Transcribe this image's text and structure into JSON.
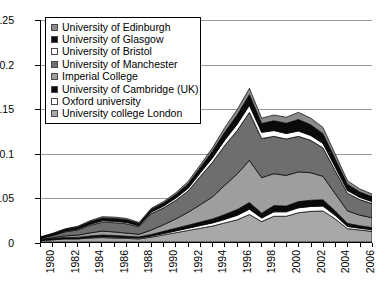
{
  "chart_data": {
    "type": "area",
    "stacked": true,
    "title": "",
    "subtitle": "",
    "xlabel": "",
    "ylabel": "",
    "grid": true,
    "legend_position": "top-left",
    "xlim": [
      1980,
      2007
    ],
    "ylim": [
      0,
      0.25
    ],
    "ytick_labels": [
      "0",
      "0.05",
      "0.1",
      "0.15",
      "0.2",
      "0.25"
    ],
    "ytick_values": [
      0,
      0.05,
      0.1,
      0.15,
      0.2,
      0.25
    ],
    "x": [
      1980,
      1981,
      1982,
      1983,
      1984,
      1985,
      1986,
      1987,
      1988,
      1989,
      1990,
      1991,
      1992,
      1993,
      1994,
      1995,
      1996,
      1997,
      1998,
      1999,
      2000,
      2001,
      2002,
      2003,
      2004,
      2005,
      2006,
      2007
    ],
    "xtick_labels": [
      "1980",
      "",
      "1982",
      "",
      "1984",
      "",
      "1986",
      "",
      "1988",
      "",
      "1990",
      "",
      "1992",
      "",
      "1994",
      "",
      "1996",
      "",
      "1998",
      "",
      "2000",
      "",
      "2002",
      "",
      "2004",
      "",
      "2006",
      ""
    ],
    "series": [
      {
        "name": "University college London",
        "color": "#a8a8a8",
        "values": [
          0.0015,
          0.0025,
          0.0035,
          0.0035,
          0.0045,
          0.005,
          0.0045,
          0.004,
          0.0035,
          0.0055,
          0.008,
          0.0105,
          0.013,
          0.0155,
          0.018,
          0.0215,
          0.025,
          0.031,
          0.023,
          0.029,
          0.029,
          0.033,
          0.0345,
          0.035,
          0.026,
          0.015,
          0.0135,
          0.012
        ]
      },
      {
        "name": "Oxford university",
        "color": "#ffffff",
        "values": [
          0.0005,
          0.0005,
          0.0005,
          0.0005,
          0.0008,
          0.001,
          0.001,
          0.001,
          0.001,
          0.0012,
          0.0015,
          0.002,
          0.0025,
          0.003,
          0.0035,
          0.004,
          0.005,
          0.006,
          0.004,
          0.005,
          0.005,
          0.0055,
          0.0055,
          0.0055,
          0.004,
          0.0025,
          0.002,
          0.0018
        ]
      },
      {
        "name": "University of Cambridge (UK)",
        "color": "#0a0a0a",
        "values": [
          0.0008,
          0.001,
          0.0012,
          0.0012,
          0.0015,
          0.0018,
          0.0018,
          0.0015,
          0.0012,
          0.0018,
          0.0025,
          0.003,
          0.0035,
          0.004,
          0.0045,
          0.0055,
          0.0065,
          0.0075,
          0.0055,
          0.007,
          0.0065,
          0.007,
          0.007,
          0.007,
          0.005,
          0.0035,
          0.0028,
          0.0025
        ]
      },
      {
        "name": "Imperial College",
        "color": "#9e9e9e",
        "values": [
          0.0005,
          0.001,
          0.0018,
          0.0025,
          0.0035,
          0.0045,
          0.004,
          0.0035,
          0.003,
          0.005,
          0.0075,
          0.0105,
          0.0145,
          0.0195,
          0.025,
          0.033,
          0.04,
          0.0475,
          0.04,
          0.036,
          0.0345,
          0.0335,
          0.031,
          0.0265,
          0.0195,
          0.014,
          0.012,
          0.011
        ]
      },
      {
        "name": "University of Manchester",
        "color": "#6e6e6e",
        "values": [
          0.001,
          0.0025,
          0.0045,
          0.006,
          0.0085,
          0.01,
          0.0105,
          0.0105,
          0.0085,
          0.0185,
          0.019,
          0.021,
          0.024,
          0.032,
          0.039,
          0.045,
          0.049,
          0.054,
          0.044,
          0.042,
          0.041,
          0.04,
          0.0365,
          0.032,
          0.026,
          0.02,
          0.0175,
          0.016
        ]
      },
      {
        "name": "University of Bristol",
        "color": "#ffffff",
        "values": [
          0.0003,
          0.0005,
          0.0008,
          0.001,
          0.0012,
          0.0015,
          0.0015,
          0.0015,
          0.0012,
          0.0018,
          0.002,
          0.0025,
          0.003,
          0.004,
          0.005,
          0.006,
          0.007,
          0.008,
          0.007,
          0.0065,
          0.0062,
          0.006,
          0.0055,
          0.005,
          0.004,
          0.003,
          0.0025,
          0.0022
        ]
      },
      {
        "name": "University of Glasgow",
        "color": "#0a0a0a",
        "values": [
          0.001,
          0.0015,
          0.002,
          0.0022,
          0.0028,
          0.0032,
          0.0032,
          0.003,
          0.0025,
          0.003,
          0.0035,
          0.004,
          0.005,
          0.006,
          0.0075,
          0.009,
          0.0105,
          0.012,
          0.01,
          0.011,
          0.0115,
          0.013,
          0.012,
          0.011,
          0.009,
          0.007,
          0.006,
          0.0055
        ]
      },
      {
        "name": "University of Edinburgh",
        "color": "#8c8c8c",
        "values": [
          0.0004,
          0.0005,
          0.0007,
          0.0008,
          0.0012,
          0.0015,
          0.0015,
          0.0015,
          0.0011,
          0.0012,
          0.0015,
          0.002,
          0.0025,
          0.003,
          0.0038,
          0.005,
          0.006,
          0.007,
          0.006,
          0.0065,
          0.0068,
          0.008,
          0.0075,
          0.007,
          0.0055,
          0.004,
          0.0035,
          0.003
        ]
      }
    ]
  },
  "legend": {
    "items": [
      {
        "label": "University of Edinburgh",
        "color": "#8c8c8c"
      },
      {
        "label": "University of Glasgow",
        "color": "#0a0a0a"
      },
      {
        "label": "University of Bristol",
        "color": "#ffffff"
      },
      {
        "label": "University of Manchester",
        "color": "#6e6e6e"
      },
      {
        "label": "Imperial College",
        "color": "#9e9e9e"
      },
      {
        "label": "University of Cambridge (UK)",
        "color": "#0a0a0a"
      },
      {
        "label": "Oxford university",
        "color": "#ffffff"
      },
      {
        "label": "University college London",
        "color": "#a8a8a8"
      }
    ]
  }
}
